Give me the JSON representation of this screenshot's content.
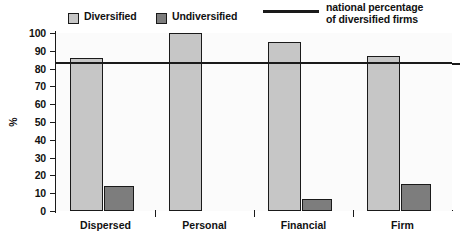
{
  "chart_data": {
    "type": "bar",
    "title": "",
    "xlabel": "",
    "ylabel": "%",
    "ylim": [
      0,
      100
    ],
    "yticks": [
      0,
      10,
      20,
      30,
      40,
      50,
      60,
      70,
      80,
      90,
      100
    ],
    "grid": false,
    "legend_position": "top",
    "categories": [
      "Dispersed",
      "Personal",
      "Financial",
      "Firm"
    ],
    "series": [
      {
        "name": "Diversified",
        "color": "#c6c6c6",
        "values": [
          86,
          100,
          95,
          87
        ]
      },
      {
        "name": "Undiversified",
        "color": "#7d7d7d",
        "values": [
          14,
          0,
          7,
          15
        ]
      }
    ],
    "reference_line": {
      "label": "national percentage of diversified firms",
      "value": 83,
      "color": "#1a1a1a"
    }
  },
  "legend": {
    "items": [
      {
        "label": "Diversified",
        "marker": "square-light-swatch"
      },
      {
        "label": "Undiversified",
        "marker": "square-dark-swatch"
      },
      {
        "label": "national percentage of diversified firms",
        "marker": "line-marker"
      }
    ],
    "national_line_1": "national percentage",
    "national_line_2": "of diversified firms"
  },
  "axis": {
    "y_title": "%",
    "y_tick_labels": [
      "100",
      "90",
      "80",
      "70",
      "60",
      "50",
      "40",
      "30",
      "20",
      "10",
      "0"
    ],
    "x_tick_labels": [
      "Dispersed",
      "Personal",
      "Financial",
      "Firm"
    ]
  }
}
